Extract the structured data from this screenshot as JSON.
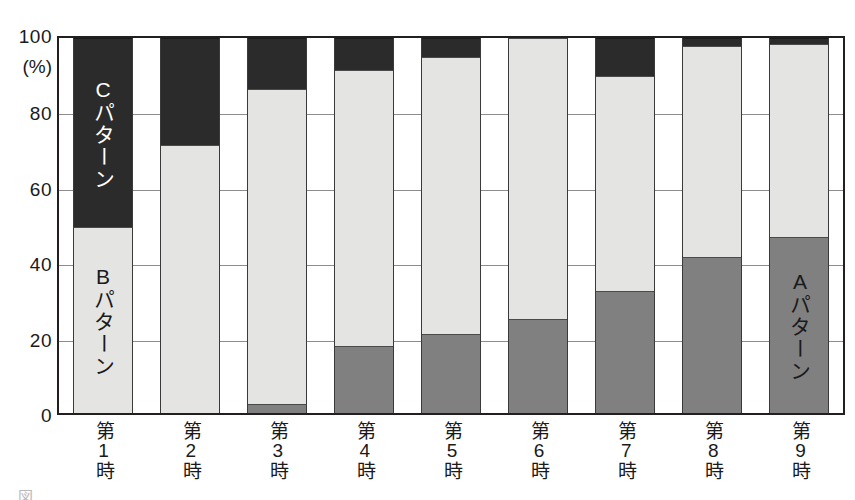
{
  "chart_data": {
    "type": "bar",
    "subtype": "100% stacked column",
    "title": "",
    "xlabel": "",
    "ylabel": "",
    "unit_label": "(%)",
    "ylim": [
      0,
      100
    ],
    "y_ticks": [
      "0",
      "20",
      "40",
      "60",
      "80",
      "100"
    ],
    "grid": true,
    "legend_position": "in-bar annotations",
    "categories": [
      "第1時",
      "第2時",
      "第3時",
      "第4時",
      "第5時",
      "第6時",
      "第7時",
      "第8時",
      "第9時"
    ],
    "series": [
      {
        "name": "Aパターン",
        "color": "#808080",
        "values": [
          0,
          0,
          2.5,
          18,
          21,
          25,
          32.5,
          41.5,
          47
        ]
      },
      {
        "name": "Bパターン",
        "color": "#e4e4e2",
        "values": [
          49.5,
          71.5,
          84,
          73.5,
          74,
          75,
          57.5,
          56.5,
          51.5
        ]
      },
      {
        "name": "Cパターン",
        "color": "#2b2b2b",
        "values": [
          50.5,
          28.5,
          13.5,
          8.5,
          5,
          0,
          10,
          2,
          1.5
        ]
      }
    ],
    "annotations": [
      {
        "text": "Cパターン",
        "bar_index": 0,
        "series": "Cパターン",
        "orientation": "vertical",
        "text_color": "#ffffff"
      },
      {
        "text": "Bパターン",
        "bar_index": 0,
        "series": "Bパターン",
        "orientation": "vertical",
        "text_color": "#1a1a1a"
      },
      {
        "text": "Aパターン",
        "bar_index": 8,
        "series": "Aパターン",
        "orientation": "vertical",
        "text_color": "#1a1a1a"
      }
    ]
  },
  "axis": {
    "unit": "(%)",
    "ticks": [
      {
        "value": 100,
        "label": "100"
      },
      {
        "value": 80,
        "label": "80"
      },
      {
        "value": 60,
        "label": "60"
      },
      {
        "value": 40,
        "label": "40"
      },
      {
        "value": 20,
        "label": "20"
      },
      {
        "value": 0,
        "label": "0"
      }
    ]
  },
  "x_labels": [
    "第1時",
    "第2時",
    "第3時",
    "第4時",
    "第5時",
    "第6時",
    "第7時",
    "第8時",
    "第9時"
  ],
  "in_bar_labels": {
    "c_pattern": "Cパターン",
    "b_pattern": "Bパターン",
    "a_pattern": "Aパターン"
  },
  "caption": {
    "cropped_text": "図 　　 　　 　　 　　 　　 　　　 　　 　　　"
  },
  "colors": {
    "series_a": "#808080",
    "series_b": "#e4e4e2",
    "series_c": "#2b2b2b",
    "frame": "#231f20",
    "gridline": "#8d8d8d",
    "background": "#ffffff"
  }
}
